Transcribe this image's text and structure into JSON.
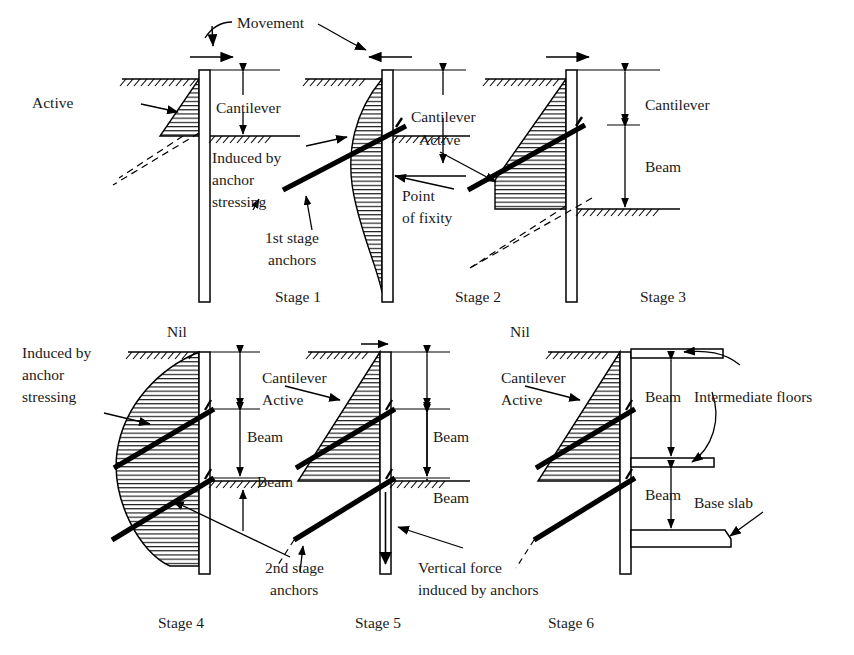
{
  "figure": {
    "type": "diagram",
    "top_annotation": "Movement"
  },
  "colors": {
    "ink": "#1a1a1a",
    "line": "#000000",
    "background": "#ffffff"
  },
  "labels": {
    "movement": "Movement",
    "active": "Active",
    "cantilever": "Cantilever",
    "beam": "Beam",
    "nil": "Nil",
    "induced_by": "Induced by",
    "anchor": "anchor",
    "stressing": "stressing",
    "first_stage": "1st stage",
    "second_stage": "2nd stage",
    "anchors": "anchors",
    "point": "Point",
    "of_fixity": "of fixity",
    "vertical_force": "Vertical force",
    "induced_by_anchors": "induced by anchors",
    "intermediate_floors": "Intermediate floors",
    "base_slab": "Base slab"
  },
  "stages": [
    {
      "id": "stage-1",
      "caption": "Stage 1",
      "movement_arrow": "right",
      "pressure_shape": "triangle",
      "pressure_label": "Active",
      "dimension_labels": [
        "Cantilever"
      ],
      "anchors": [],
      "notes": [
        "Active",
        "Cantilever"
      ]
    },
    {
      "id": "stage-2",
      "caption": "Stage 2",
      "movement_arrow": "left",
      "pressure_shape": "bulge",
      "pressure_label": "Induced by anchor stressing",
      "dimension_labels": [
        "Cantilever"
      ],
      "anchors": [
        "1st stage anchors"
      ],
      "notes": [
        "Induced by",
        "anchor",
        "stressing",
        "1st stage",
        "anchors",
        "Cantilever",
        "Active",
        "Point",
        "of fixity"
      ]
    },
    {
      "id": "stage-3",
      "caption": "Stage 3",
      "movement_arrow": "right",
      "pressure_shape": "trapezoid",
      "pressure_label": "Active",
      "dimension_labels": [
        "Cantilever",
        "Beam"
      ],
      "anchors": [
        "1st stage anchors"
      ],
      "notes": [
        "Cantilever",
        "Beam"
      ]
    },
    {
      "id": "stage-4",
      "caption": "Stage 4",
      "movement_arrow": "none",
      "movement_label": "Nil",
      "pressure_shape": "lobe",
      "pressure_label": "Induced by anchor stressing",
      "dimension_labels": [
        "Beam",
        "Beam"
      ],
      "anchors": [
        "1st stage anchors",
        "2nd stage anchors"
      ],
      "notes": [
        "Induced by",
        "anchor",
        "stressing",
        "Nil",
        "Beam",
        "Beam",
        "2nd stage",
        "anchors"
      ]
    },
    {
      "id": "stage-5",
      "caption": "Stage 5",
      "movement_arrow": "right",
      "pressure_shape": "triangle",
      "pressure_label": "Cantilever Active",
      "dimension_labels": [
        "Beam",
        "Beam"
      ],
      "anchors": [
        "1st stage anchors",
        "2nd stage anchors"
      ],
      "notes": [
        "Cantilever",
        "Active",
        "Beam",
        "Beam",
        "Vertical force",
        "induced by anchors"
      ]
    },
    {
      "id": "stage-6",
      "caption": "Stage 6",
      "movement_arrow": "none",
      "movement_label": "Nil",
      "pressure_shape": "triangle",
      "pressure_label": "Cantilever Active",
      "dimension_labels": [
        "Beam",
        "Beam"
      ],
      "anchors": [
        "1st stage anchors",
        "2nd stage anchors"
      ],
      "structures": [
        "Intermediate floors",
        "Base slab"
      ],
      "notes": [
        "Nil",
        "Cantilever",
        "Active",
        "Beam",
        "Beam",
        "Intermediate floors",
        "Base slab"
      ]
    }
  ]
}
